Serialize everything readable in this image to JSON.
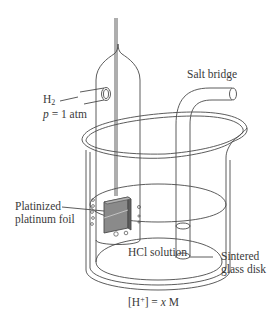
{
  "diagram": {
    "labels": {
      "h2_symbol": "H",
      "h2_subscript": "2",
      "pressure_var": "p",
      "pressure_value": " = 1 atm",
      "salt_bridge": "Salt bridge",
      "platinized_line1": "Platinized",
      "platinized_line2": "platinum foil",
      "sintered_line1": "Sintered",
      "sintered_line2": "glass disk",
      "hcl_solution": "HCl solution",
      "concentration_open": "[H",
      "concentration_sup": "+",
      "concentration_close": "] = ",
      "concentration_var": "x",
      "concentration_unit": " M"
    },
    "colors": {
      "line": "#4a4a4a",
      "foil_dark": "#6e6e6e",
      "foil_light": "#a8a8a8",
      "text": "#3a3a3a"
    }
  }
}
